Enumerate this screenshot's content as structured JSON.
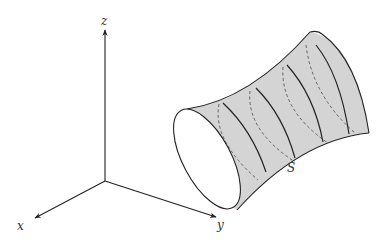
{
  "figure": {
    "type": "3D surface diagram (hyperboloid-like tube)",
    "axes": {
      "x_label": "x",
      "y_label": "y",
      "z_label": "z"
    },
    "surface_label": "S",
    "colors": {
      "surface_fill": "#d4d4d4",
      "stroke": "#222222",
      "background": "#ffffff"
    },
    "cross_sections": {
      "solid": 4,
      "dashed_hidden": 4
    }
  }
}
